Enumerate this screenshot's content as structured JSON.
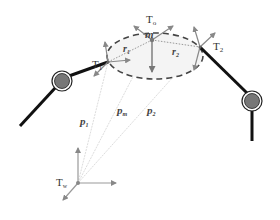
{
  "diagram": {
    "type": "robotic dual-arm manipulation of object",
    "colors": {
      "arm": "#111111",
      "joint_fill": "#777777",
      "joint_ring": "#222222",
      "arrow": "#888888",
      "ellipse_dash": "#444444",
      "ellipse_fill": "#f2f2f2",
      "dotted_line": "#999999",
      "vector_line": "#dddddd",
      "axis": "#999999"
    },
    "labels": {
      "object_frame": "T",
      "object_frame_sub": "o",
      "mass": "m",
      "contact_left": "T",
      "contact_left_sub": "1",
      "contact_right": "T",
      "contact_right_sub": "2",
      "radius_left": "r",
      "radius_left_sub": "1",
      "radius_right": "r",
      "radius_right_sub": "2",
      "pos_left": "p",
      "pos_left_sub": "1",
      "pos_mass": "p",
      "pos_mass_sub": "m",
      "pos_right": "p",
      "pos_right_sub": "2",
      "world_frame": "T",
      "world_frame_sub": "w"
    }
  }
}
